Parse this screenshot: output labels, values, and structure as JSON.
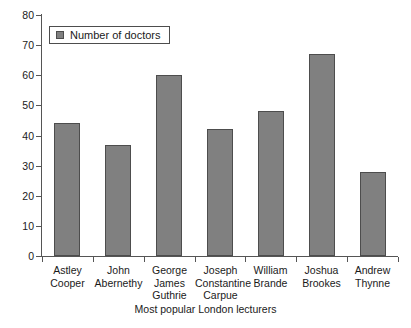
{
  "chart_data": {
    "type": "bar",
    "title": "",
    "subtitle": "",
    "xlabel": "Most popular London lecturers",
    "ylabel": "",
    "categories": [
      "Astley Cooper",
      "John Abernethy",
      "George James Guthrie",
      "Joseph Constantine Carpue",
      "William Brande",
      "Joshua Brookes",
      "Andrew Thynne"
    ],
    "category_lines": [
      [
        "Astley",
        "Cooper"
      ],
      [
        "John",
        "Abernethy"
      ],
      [
        "George",
        "James",
        "Guthrie"
      ],
      [
        "Joseph",
        "Constantine",
        "Carpue"
      ],
      [
        "William",
        "Brande"
      ],
      [
        "Joshua",
        "Brookes"
      ],
      [
        "Andrew",
        "Thynne"
      ]
    ],
    "series": [
      {
        "name": "Number of doctors",
        "values": [
          44,
          37,
          60,
          42,
          48,
          67,
          28
        ],
        "color": "#808080"
      }
    ],
    "ylim": [
      0,
      80
    ],
    "yticks": [
      0,
      10,
      20,
      30,
      40,
      50,
      60,
      70,
      80
    ],
    "ytick_labels": [
      "0",
      "10",
      "20",
      "30",
      "40",
      "50",
      "60",
      "70",
      "80"
    ],
    "grid": false,
    "legend_position": "top-left",
    "bar_border_color": "#4d4d4d",
    "axis_color": "#555555"
  },
  "legend": {
    "entries": [
      {
        "label": "Number of doctors",
        "color": "#808080"
      }
    ]
  }
}
